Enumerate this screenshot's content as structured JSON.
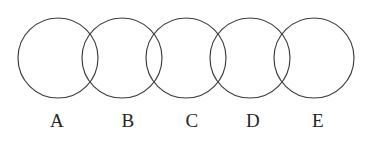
{
  "figure": {
    "title": "",
    "width": 379,
    "height": 142,
    "background_color": "#ffffff",
    "stroke_color": "#3b3b3b",
    "label_color": "#262626"
  },
  "chart_data": {
    "type": "diagram",
    "subtype": "venn-chain",
    "title": "",
    "xlabel": "",
    "ylabel": "",
    "shape": "circle",
    "count": 5,
    "radius": 40,
    "center_y": 58,
    "center_spacing": 64,
    "categories": [
      "A",
      "B",
      "C",
      "D",
      "E"
    ],
    "circles": [
      {
        "label": "A",
        "cx": 58,
        "cy": 58,
        "r": 40
      },
      {
        "label": "B",
        "cx": 122,
        "cy": 58,
        "r": 40
      },
      {
        "label": "C",
        "cx": 186,
        "cy": 58,
        "r": 40
      },
      {
        "label": "D",
        "cx": 250,
        "cy": 58,
        "r": 40
      },
      {
        "label": "E",
        "cx": 314,
        "cy": 58,
        "r": 40
      }
    ],
    "labels": [
      {
        "text": "A",
        "x": 57,
        "y": 111
      },
      {
        "text": "B",
        "x": 128,
        "y": 111
      },
      {
        "text": "C",
        "x": 192,
        "y": 111
      },
      {
        "text": "D",
        "x": 253,
        "y": 111
      },
      {
        "text": "E",
        "x": 318,
        "y": 111
      }
    ],
    "overlaps": [
      "A-B",
      "B-C",
      "C-D",
      "D-E"
    ]
  }
}
